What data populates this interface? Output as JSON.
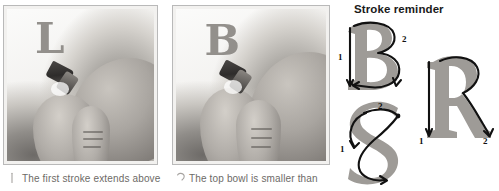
{
  "page": {
    "background_color": "#ffffff",
    "text_color": "#6d6a66"
  },
  "photos": [
    {
      "id": "photo-1",
      "alt_label": "hand holding calligraphy pen writing first stroke of letter B",
      "written_letter": "L",
      "letter_color": "#8e8b87"
    },
    {
      "id": "photo-2",
      "alt_label": "hand holding calligraphy pen completing letter B",
      "written_letter": "B",
      "letter_color": "#8e8b87"
    }
  ],
  "captions": [
    {
      "marker": "vertical-stroke-marker",
      "text": "The first stroke extends above"
    },
    {
      "marker": "bowl-arc-marker",
      "text": "The top bowl is smaller than"
    }
  ],
  "stroke_reminder": {
    "title": "Stroke reminder",
    "title_color": "#1a1a1a",
    "glyph_color": "#9e9b97",
    "stroke_color": "#111111",
    "figures": [
      {
        "letter": "B",
        "name": "stroke-figure-b",
        "stroke_numbers": [
          "1",
          "2"
        ]
      },
      {
        "letter": "R",
        "name": "stroke-figure-r",
        "stroke_numbers": [
          "1",
          "2"
        ]
      },
      {
        "letter": "S",
        "name": "stroke-figure-s",
        "stroke_numbers": [
          "1",
          "2"
        ]
      }
    ]
  }
}
